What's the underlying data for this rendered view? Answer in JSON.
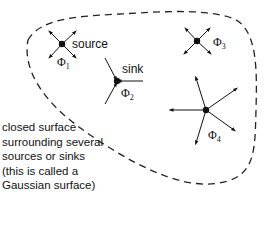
{
  "diagram": {
    "surface": {
      "style": "dashed",
      "color": "#222222"
    },
    "charges": [
      {
        "id": "phi1",
        "symbol": "Φ",
        "subscript": "1",
        "label": "source",
        "type": "source",
        "arrows": 4
      },
      {
        "id": "phi2",
        "symbol": "Φ",
        "subscript": "2",
        "label": "sink",
        "type": "sink",
        "arrows": 3
      },
      {
        "id": "phi3",
        "symbol": "Φ",
        "subscript": "3",
        "label": "",
        "type": "source",
        "arrows": 4
      },
      {
        "id": "phi4",
        "symbol": "Φ",
        "subscript": "4",
        "label": "",
        "type": "source",
        "arrows": 5
      }
    ],
    "caption_lines": [
      "closed surface",
      "surrounding several",
      "sources or sinks",
      "(this is called a",
      "Gaussian surface)"
    ]
  }
}
